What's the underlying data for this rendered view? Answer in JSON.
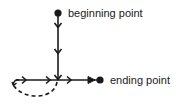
{
  "diagram": {
    "labels": {
      "beginning": "beginning point",
      "ending": "ending point"
    },
    "colors": {
      "stroke": "#1a1a1a",
      "background": "#ffffff"
    },
    "nodes": [
      {
        "id": "beginning-point",
        "x": 58,
        "y": 13
      },
      {
        "id": "ending-point",
        "x": 100,
        "y": 80
      },
      {
        "id": "junction",
        "x": 58,
        "y": 80
      }
    ],
    "paths": [
      {
        "id": "vertical-path",
        "from": "beginning-point",
        "to": "junction",
        "style": "solid",
        "arrows": 3
      },
      {
        "id": "horizontal-path",
        "from": "left-start",
        "to": "ending-point",
        "style": "solid",
        "arrows": 4
      },
      {
        "id": "loop-path",
        "from": "junction",
        "to": "left-start",
        "style": "dashed"
      }
    ]
  }
}
